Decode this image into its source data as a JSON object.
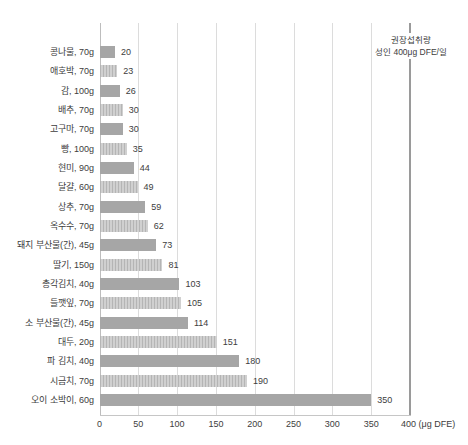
{
  "colors": {
    "background": "#ffffff",
    "bar_solid": "#a6a6a6",
    "bar_hatch_light": "#d0d0d0",
    "bar_hatch_dark": "#b5b5b5",
    "gridline": "#dcdcdc",
    "zero_line": "#bdbdbd",
    "reference_line": "#9a9a9a",
    "axis_line": "#c6c6c6",
    "text": "#3d3d3d"
  },
  "chart_data": {
    "type": "bar",
    "orientation": "horizontal",
    "title": "",
    "categories": [
      "콩나물, 70g",
      "애호박, 70g",
      "감, 100g",
      "배추, 70g",
      "고구마, 70g",
      "빵, 100g",
      "현미, 90g",
      "달걀, 60g",
      "상추, 70g",
      "옥수수, 70g",
      "돼지 부산물(간), 45g",
      "딸기, 150g",
      "총각김치, 40g",
      "들깻잎, 70g",
      "소 부산물(간), 45g",
      "대두, 20g",
      "파 김치, 40g",
      "시금치, 70g",
      "오이 소박이, 60g"
    ],
    "values": [
      20,
      23,
      26,
      30,
      30,
      35,
      44,
      49,
      59,
      62,
      73,
      81,
      103,
      105,
      114,
      151,
      180,
      190,
      350
    ],
    "bar_style_alternating": [
      "solid",
      "hatched"
    ],
    "xlim": [
      0,
      400
    ],
    "xticks": [
      0,
      50,
      100,
      150,
      200,
      250,
      300,
      350,
      400
    ],
    "x_unit_label": "(μg DFE)",
    "grid": true,
    "legend": null,
    "reference_line": {
      "value": 400,
      "label_line1": "권장섭취량",
      "label_line2": "성인 400μg DFE/일"
    }
  }
}
